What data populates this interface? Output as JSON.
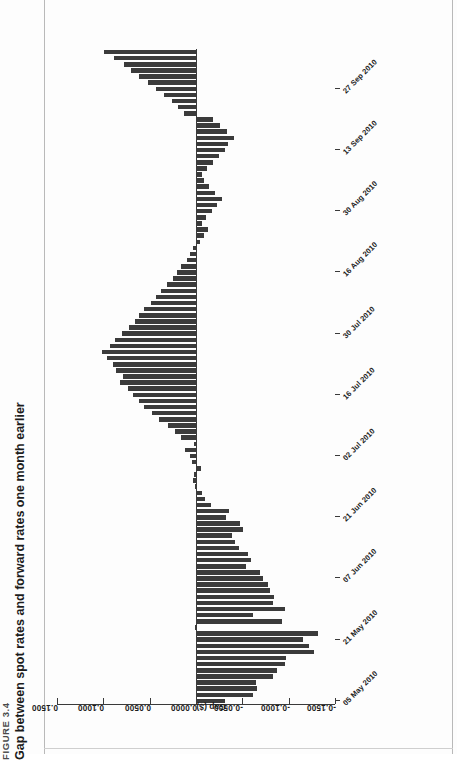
{
  "figure": {
    "number": "FIGURE 3.4",
    "title": "Gap between spot rates and forward rates one month earlier"
  },
  "chart_data": {
    "type": "bar",
    "orientation": "horizontal",
    "title": "Gap between spot rates and forward rates one month earlier",
    "xlabel": "",
    "ylabel": "Gap ($)",
    "ylim": [
      -0.15,
      0.15
    ],
    "yticks": [
      0.15,
      0.1,
      0.05,
      0.0,
      -0.05,
      -0.1,
      -0.15
    ],
    "ytick_labels": [
      "0.1500",
      "0.1000",
      "0.0500",
      "0.0000",
      "-0.0500",
      "-0.1000",
      "-0.1500"
    ],
    "grid": false,
    "legend": null,
    "bar_color": "#3b3b3b",
    "categories_shown": [
      "05 May 2010",
      "21 May 2010",
      "07 Jun 2010",
      "21 Jun 2010",
      "02 Jul 2010",
      "16 Jul 2010",
      "30 Jul 2010",
      "16 Aug 2010",
      "30 Aug 2010",
      "13 Sep 2010",
      "27 Sep 2010"
    ],
    "category_tick_every": 10,
    "n_bars": 107,
    "values": [
      -0.031,
      -0.061,
      -0.066,
      -0.065,
      -0.083,
      -0.087,
      -0.096,
      -0.097,
      -0.127,
      -0.122,
      -0.116,
      -0.132,
      0.0015,
      -0.093,
      -0.062,
      -0.096,
      -0.083,
      -0.084,
      -0.08,
      -0.078,
      -0.072,
      -0.069,
      -0.054,
      -0.059,
      -0.056,
      -0.046,
      -0.042,
      -0.039,
      -0.051,
      -0.047,
      -0.032,
      -0.036,
      -0.016,
      -0.01,
      -0.006,
      0.001,
      0.003,
      0.002,
      -0.005,
      0.004,
      0.006,
      0.012,
      0.002,
      0.016,
      0.023,
      0.03,
      0.04,
      0.047,
      0.056,
      0.061,
      0.068,
      0.073,
      0.082,
      0.079,
      0.086,
      0.09,
      0.096,
      0.101,
      0.093,
      0.087,
      0.08,
      0.072,
      0.066,
      0.061,
      0.056,
      0.049,
      0.043,
      0.038,
      0.031,
      0.025,
      0.021,
      0.016,
      0.01,
      0.006,
      0.003,
      -0.004,
      -0.009,
      -0.013,
      -0.006,
      -0.011,
      -0.017,
      -0.023,
      -0.028,
      -0.02,
      -0.014,
      -0.009,
      -0.006,
      -0.012,
      -0.018,
      -0.025,
      -0.031,
      -0.035,
      -0.041,
      -0.033,
      -0.026,
      -0.018,
      0.013,
      0.019,
      0.026,
      0.034,
      0.043,
      0.052,
      0.061,
      0.07,
      0.078,
      0.088,
      0.099
    ]
  }
}
